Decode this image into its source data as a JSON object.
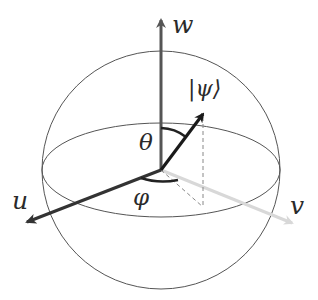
{
  "diagram": {
    "labels": {
      "w_axis": "w",
      "u_axis": "u",
      "v_axis": "v",
      "state": "|ψ⟩",
      "theta": "θ",
      "phi": "φ"
    },
    "colors": {
      "sphere_outline": "#555555",
      "w_axis": "#555555",
      "u_axis": "#333333",
      "v_axis": "#d0d0d0",
      "state_vector": "#1a1a1a",
      "dashed_projection": "#888888",
      "angle_arcs": "#222222"
    }
  }
}
